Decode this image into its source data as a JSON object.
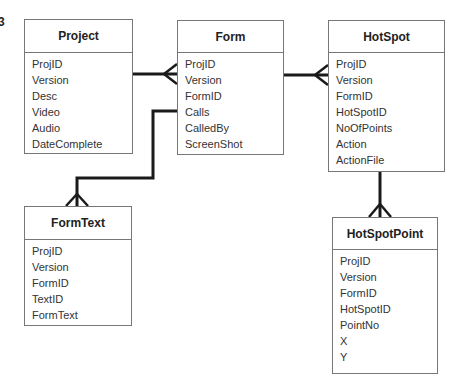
{
  "figure": {
    "number_fragment": "3"
  },
  "entities": {
    "project": {
      "title": "Project",
      "fields": [
        "ProjID",
        "Version",
        "Desc",
        "Video",
        "Audio",
        "DateComplete"
      ]
    },
    "form": {
      "title": "Form",
      "fields": [
        "ProjID",
        "Version",
        "FormID",
        "Calls",
        "CalledBy",
        "ScreenShot"
      ]
    },
    "hotspot": {
      "title": "HotSpot",
      "fields": [
        "ProjID",
        "Version",
        "FormID",
        "HotSpotID",
        "NoOfPoints",
        "Action",
        "ActionFile"
      ]
    },
    "formtext": {
      "title": "FormText",
      "fields": [
        "ProjID",
        "Version",
        "FormID",
        "TextID",
        "FormText"
      ]
    },
    "hotspotpoint": {
      "title": "HotSpotPoint",
      "fields": [
        "ProjID",
        "Version",
        "FormID",
        "HotSpotID",
        "PointNo",
        "X",
        "Y"
      ]
    }
  },
  "relationships": [
    {
      "from": "Project",
      "to": "Form",
      "type": "one-to-many"
    },
    {
      "from": "Form",
      "to": "HotSpot",
      "type": "one-to-many"
    },
    {
      "from": "Form",
      "to": "FormText",
      "type": "one-to-many",
      "via": "Calls"
    },
    {
      "from": "HotSpot",
      "to": "HotSpotPoint",
      "type": "one-to-many"
    }
  ],
  "colors": {
    "line": "#1a1a1a",
    "border": "#777777",
    "background": "#ffffff"
  }
}
